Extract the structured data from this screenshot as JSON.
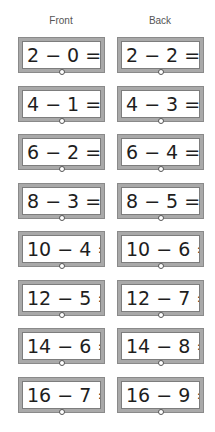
{
  "headers": {
    "front": "Front",
    "back": "Back"
  },
  "cards": [
    {
      "front": "2 − 0 = _",
      "back": "2 − 2 = _"
    },
    {
      "front": "4 − 1 = _",
      "back": "4 − 3 = _"
    },
    {
      "front": "6 − 2 = _",
      "back": "6 − 4 = _"
    },
    {
      "front": "8 − 3 = _",
      "back": "8 − 5 = _"
    },
    {
      "front": "10 − 4 = _",
      "back": "10 − 6 = _"
    },
    {
      "front": "12 − 5 = _",
      "back": "12 − 7 = _"
    },
    {
      "front": "14 − 6 = _",
      "back": "14 − 8 = _"
    },
    {
      "front": "16 − 7 = _",
      "back": "16 − 9 = _"
    }
  ],
  "colors": {
    "frame": "#a9a9a9",
    "text": "#1e1e1e",
    "label": "#555555"
  }
}
